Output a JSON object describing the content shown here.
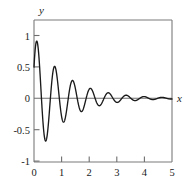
{
  "figure": {
    "background_color": "#ffffff",
    "curve_color": "#1a1a1a",
    "axis_color": "#6e6e6e"
  },
  "chart_data": {
    "type": "line",
    "title": "",
    "subtitle": "",
    "xlabel": "x",
    "ylabel": "y",
    "xlim": [
      0,
      5
    ],
    "ylim": [
      -1.25,
      1.25
    ],
    "grid": false,
    "legend": null,
    "xticks": [
      0,
      1,
      2,
      3,
      4,
      5
    ],
    "xticklabels": [
      "0",
      "1",
      "2",
      "3",
      "4",
      "5"
    ],
    "yticks": [
      -1,
      -0.5,
      0,
      0.5,
      1
    ],
    "yticklabels": [
      "-1",
      "-0.5",
      "0",
      "0.5",
      "1"
    ],
    "annotations": [],
    "series": [
      {
        "name": "damped oscillation",
        "description": "exponentially damped sinusoid",
        "function": "y = exp(-0.90*x) * sin(9.70*x + 0.52)",
        "amplitude": 1.0,
        "decay_rate": 0.9,
        "angular_frequency": 9.7,
        "phase": 0.52,
        "period": 0.648,
        "y_at_x0": 0.5,
        "first_peak": {
          "x": 0.12,
          "y": 0.88
        },
        "first_trough": {
          "x": 0.44,
          "y": -0.73
        },
        "second_peak": {
          "x": 0.77,
          "y": 0.52
        },
        "second_trough": {
          "x": 1.09,
          "y": -0.49
        },
        "third_peak": {
          "x": 1.41,
          "y": 0.36
        },
        "third_trough": {
          "x": 1.74,
          "y": -0.32
        },
        "fourth_peak": {
          "x": 2.06,
          "y": 0.24
        },
        "fifth_peak": {
          "x": 2.71,
          "y": 0.15
        },
        "x": [
          0.0,
          0.05,
          0.1,
          0.15,
          0.2,
          0.25,
          0.3,
          0.35,
          0.4,
          0.45,
          0.5,
          0.55,
          0.6,
          0.65,
          0.7,
          0.75,
          0.8,
          0.85,
          0.9,
          0.95,
          1.0,
          1.05,
          1.1,
          1.15,
          1.2,
          1.25,
          1.3,
          1.35,
          1.4,
          1.45,
          1.5,
          1.55,
          1.6,
          1.65,
          1.7,
          1.75,
          1.8,
          1.85,
          1.9,
          1.95,
          2.0,
          2.1,
          2.2,
          2.3,
          2.4,
          2.5,
          2.6,
          2.7,
          2.8,
          2.9,
          3.0,
          3.1,
          3.2,
          3.3,
          3.4,
          3.5,
          3.6,
          3.7,
          3.8,
          3.9,
          4.0,
          4.2,
          4.4,
          4.6,
          4.8,
          5.0
        ],
        "y": [
          0.497,
          0.839,
          0.861,
          0.553,
          0.063,
          -0.427,
          -0.716,
          -0.696,
          -0.399,
          0.029,
          0.417,
          0.62,
          0.57,
          0.302,
          -0.063,
          -0.376,
          -0.518,
          -0.443,
          -0.197,
          0.106,
          0.339,
          0.411,
          0.31,
          0.095,
          -0.14,
          -0.3,
          -0.327,
          -0.222,
          -0.035,
          0.149,
          0.256,
          0.249,
          0.141,
          -0.013,
          -0.145,
          -0.21,
          -0.187,
          -0.093,
          0.03,
          0.133,
          0.176,
          0.107,
          -0.053,
          -0.125,
          -0.052,
          0.07,
          0.103,
          0.028,
          -0.065,
          -0.082,
          -0.028,
          0.05,
          0.065,
          0.027,
          -0.035,
          -0.051,
          -0.026,
          0.022,
          0.04,
          0.024,
          -0.012,
          -0.025,
          -0.018,
          0.0,
          0.013,
          0.012
        ]
      }
    ]
  }
}
